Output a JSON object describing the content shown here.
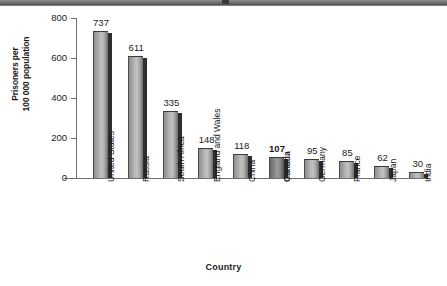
{
  "chart_data": {
    "type": "bar",
    "title": "",
    "xlabel": "Country",
    "ylabel_line1": "Prisoners per",
    "ylabel_line2": "100 000 population",
    "ylim": [
      0,
      800
    ],
    "yticks": [
      0,
      200,
      400,
      600,
      800
    ],
    "ytick_labels": [
      "0",
      "200",
      "400",
      "600",
      "800"
    ],
    "grid": false,
    "legend": "none",
    "highlight_category": "Canada",
    "categories": [
      "United States",
      "Russia",
      "South Africa",
      "England and Wales",
      "China",
      "Canada",
      "Germany",
      "France",
      "Japan",
      "India"
    ],
    "values": [
      737,
      611,
      335,
      148,
      118,
      107,
      95,
      85,
      62,
      30
    ],
    "value_labels": [
      "737",
      "611",
      "335",
      "148",
      "118",
      "107",
      "95",
      "85",
      "62",
      "30"
    ],
    "bar_color": "#b0b0b0",
    "bar_edge_color": "#2e2e2e",
    "highlight_bar_color": "#8a8a8a",
    "axis_color": "#6f6f6f",
    "text_color": "#1a1a1a",
    "band_color": "#6e6e6e"
  }
}
